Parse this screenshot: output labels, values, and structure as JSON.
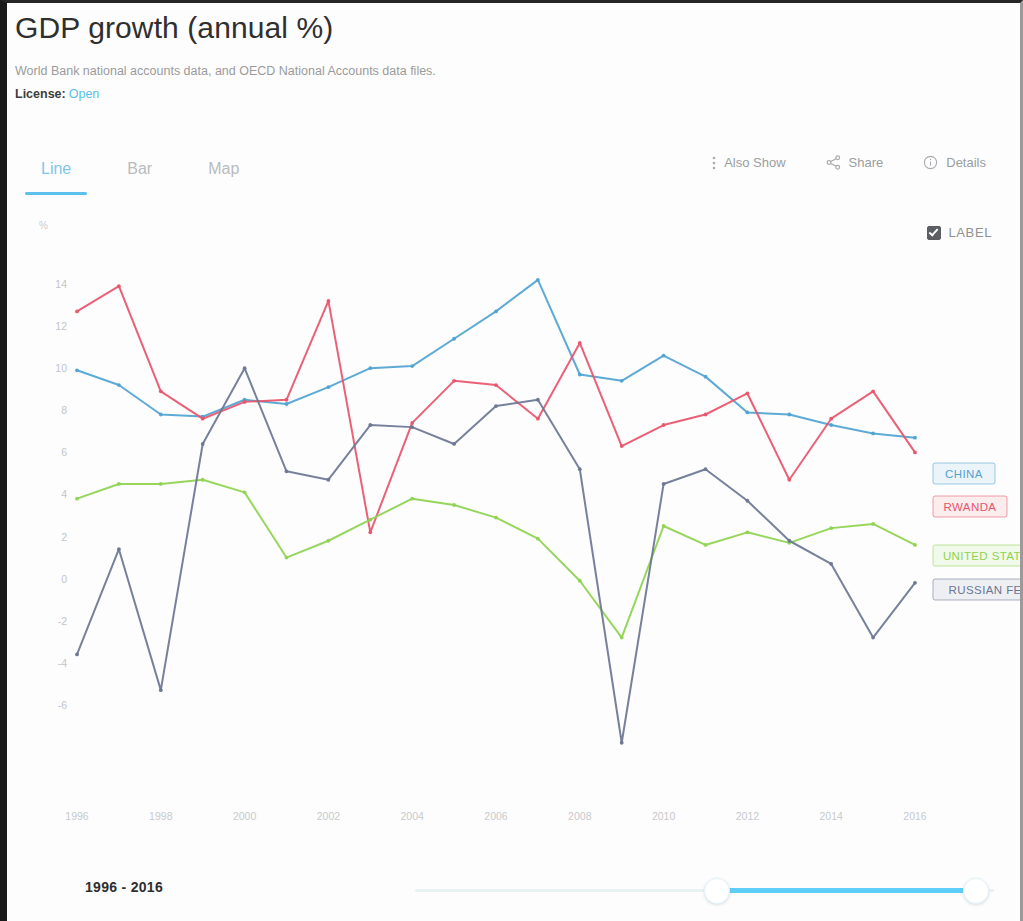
{
  "header": {
    "title": "GDP growth (annual %)",
    "source": "World Bank national accounts data, and OECD National Accounts data files.",
    "license_label": "License:",
    "license_value": "Open"
  },
  "tabs": [
    {
      "label": "Line",
      "active": true
    },
    {
      "label": "Bar",
      "active": false
    },
    {
      "label": "Map",
      "active": false
    }
  ],
  "actions": [
    {
      "label": "Also Show",
      "icon": "kebab-menu-icon"
    },
    {
      "label": "Share",
      "icon": "share-icon"
    },
    {
      "label": "Details",
      "icon": "info-circle-icon"
    }
  ],
  "label_toggle": {
    "label": "LABEL",
    "checked": true
  },
  "footer": {
    "range_text": "1996 - 2016",
    "slider": {
      "left_percent": 52,
      "right_percent": 97
    }
  },
  "colors": {
    "china": "#4fa3d1",
    "rwanda": "#e8546b",
    "united_states": "#8ed34f",
    "russian_federation": "#6b7694",
    "accent": "#5bc0eb",
    "axis_text": "#c4c7cb"
  },
  "chart_data": {
    "type": "line",
    "title": "GDP growth (annual %)",
    "xlabel": "",
    "ylabel": "%",
    "ylim": [
      -9,
      15
    ],
    "xlim": [
      1996,
      2016
    ],
    "grid": false,
    "legend": "inline-right-labels",
    "yticks": [
      14,
      12,
      10,
      8,
      6,
      4,
      2,
      0,
      -2,
      -4,
      -6
    ],
    "xticks": [
      1996,
      1998,
      2000,
      2002,
      2004,
      2006,
      2008,
      2010,
      2012,
      2014,
      2016
    ],
    "x": [
      1996,
      1997,
      1998,
      1999,
      2000,
      2001,
      2002,
      2003,
      2004,
      2005,
      2006,
      2007,
      2008,
      2009,
      2010,
      2011,
      2012,
      2013,
      2014,
      2015,
      2016
    ],
    "series": [
      {
        "name": "CHINA",
        "color": "#4fa3d1",
        "values": [
          9.9,
          9.2,
          7.8,
          7.7,
          8.5,
          8.3,
          9.1,
          10.0,
          10.1,
          11.4,
          12.7,
          14.2,
          9.7,
          9.4,
          10.6,
          9.6,
          7.9,
          7.8,
          7.3,
          6.9,
          6.7
        ]
      },
      {
        "name": "RWANDA",
        "color": "#e8546b",
        "values": [
          12.7,
          13.9,
          8.9,
          7.6,
          8.4,
          8.5,
          13.2,
          2.2,
          7.4,
          9.4,
          9.2,
          7.6,
          11.2,
          6.3,
          7.3,
          7.8,
          8.8,
          4.7,
          7.6,
          8.9,
          6.0
        ]
      },
      {
        "name": "UNITED STATES",
        "color": "#8ed34f",
        "values": [
          3.8,
          4.5,
          4.5,
          4.7,
          4.1,
          1.0,
          1.8,
          2.8,
          3.8,
          3.5,
          2.9,
          1.9,
          -0.1,
          -2.8,
          2.5,
          1.6,
          2.2,
          1.7,
          2.4,
          2.6,
          1.6
        ]
      },
      {
        "name": "RUSSIAN FEDERATION",
        "color": "#6b7694",
        "values": [
          -3.6,
          1.4,
          -5.3,
          6.4,
          10.0,
          5.1,
          4.7,
          7.3,
          7.2,
          6.4,
          8.2,
          8.5,
          5.2,
          -7.8,
          4.5,
          5.2,
          3.7,
          1.8,
          0.7,
          -2.8,
          -0.2
        ]
      }
    ],
    "annotations": [
      {
        "text": "CHINA",
        "color": "#4fa3d1",
        "at_year": 2016
      },
      {
        "text": "RWANDA",
        "color": "#e8546b",
        "at_year": 2016
      },
      {
        "text": "UNITED STATES",
        "color": "#8ed34f",
        "at_year": 2016
      },
      {
        "text": "RUSSIAN FEDERATION",
        "color": "#6b7694",
        "at_year": 2016
      }
    ]
  }
}
